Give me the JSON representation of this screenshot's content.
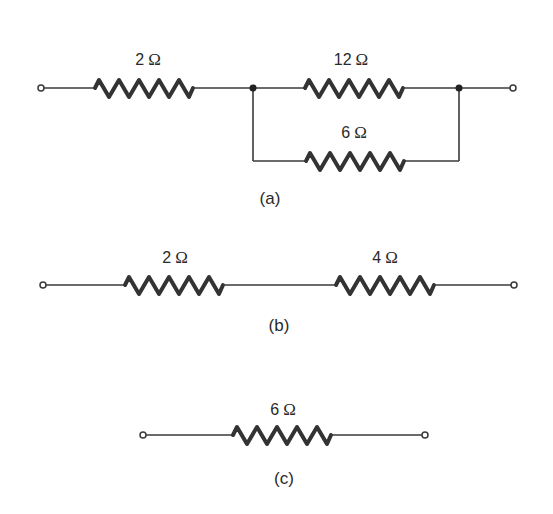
{
  "figure": {
    "circuits": [
      {
        "id": "a",
        "caption": "(a)",
        "description": "2 Ω resistor in series with parallel combination of 12 Ω and 6 Ω",
        "resistors": [
          {
            "value": "2",
            "unit": "Ω",
            "position": "series"
          },
          {
            "value": "12",
            "unit": "Ω",
            "position": "parallel-top"
          },
          {
            "value": "6",
            "unit": "Ω",
            "position": "parallel-bottom"
          }
        ]
      },
      {
        "id": "b",
        "caption": "(b)",
        "description": "2 Ω resistor in series with 4 Ω resistor",
        "resistors": [
          {
            "value": "2",
            "unit": "Ω",
            "position": "series-left"
          },
          {
            "value": "4",
            "unit": "Ω",
            "position": "series-right"
          }
        ]
      },
      {
        "id": "c",
        "caption": "(c)",
        "description": "Single equivalent 6 Ω resistor",
        "resistors": [
          {
            "value": "6",
            "unit": "Ω",
            "position": "single"
          }
        ]
      }
    ]
  },
  "colors": {
    "background": "#ffffff",
    "line": "#333333",
    "text": "#2a2a2a"
  }
}
